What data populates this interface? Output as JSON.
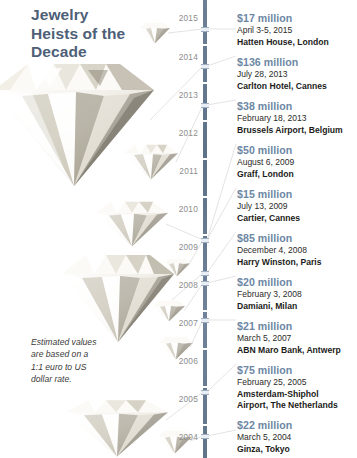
{
  "title": "Jewelry\nHeists of the\nDecade",
  "footnote": "Estimated values\nare based on a\n1:1 euro to US\ndollar rate.",
  "colors": {
    "title": "#4d6077",
    "amount": "#6d87a4",
    "axis": "#5d7189",
    "year_label": "#8d8d8d",
    "connector": "#d8d8d8",
    "background": "#ffffff"
  },
  "axis": {
    "years": [
      "2015",
      "2014",
      "2013",
      "2012",
      "2011",
      "2010",
      "2009",
      "2008",
      "2007",
      "2006",
      "2005",
      "2004"
    ]
  },
  "entries": [
    {
      "amount": "$17 million",
      "date": "April 3-5, 2015",
      "place": "Hatten House, London"
    },
    {
      "amount": "$136 million",
      "date": "July 28, 2013",
      "place": "Carlton Hotel, Cannes"
    },
    {
      "amount": "$38 million",
      "date": "February 18, 2013",
      "place": "Brussels Airport, Belgium"
    },
    {
      "amount": "$50 million",
      "date": "August 6, 2009",
      "place": "Graff, London"
    },
    {
      "amount": "$15 million",
      "date": "July 13, 2009",
      "place": "Cartier, Cannes"
    },
    {
      "amount": "$85 million",
      "date": "December 4, 2008",
      "place": "Harry Winston, Paris"
    },
    {
      "amount": "$20 million",
      "date": "February 3, 2008",
      "place": "Damiani, Milan"
    },
    {
      "amount": "$21 million",
      "date": "March 5, 2007",
      "place": "ABN Maro Bank, Antwerp"
    },
    {
      "amount": "$75 million",
      "date": "February 25, 2005",
      "place": "Amsterdam-Shiphol\nAirport, The Netherlands"
    },
    {
      "amount": "$22 million",
      "date": "March 5, 2004",
      "place": "Ginza, Tokyo"
    }
  ],
  "gems": [
    {
      "name": "gem-2015-hatten-house",
      "label": "$17 million"
    },
    {
      "name": "gem-2013-carlton-hotel",
      "label": "$136 million"
    },
    {
      "name": "gem-2013-brussels",
      "label": "$38 million"
    },
    {
      "name": "gem-2009-graff",
      "label": "$50 million"
    },
    {
      "name": "gem-2009-cartier",
      "label": "$15 million"
    },
    {
      "name": "gem-2008-harry-winston",
      "label": "$85 million"
    },
    {
      "name": "gem-2008-damiani",
      "label": "$20 million"
    },
    {
      "name": "gem-2007-abn-maro",
      "label": "$21 million"
    },
    {
      "name": "gem-2005-schiphol",
      "label": "$75 million"
    },
    {
      "name": "gem-2004-ginza",
      "label": "$22 million"
    }
  ]
}
